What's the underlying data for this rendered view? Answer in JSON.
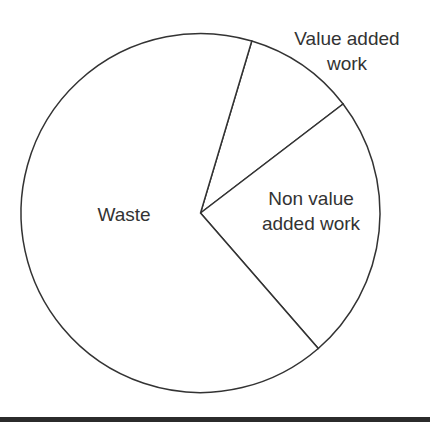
{
  "chart_data": {
    "type": "pie",
    "title": "",
    "start_angle_deg": 16.6,
    "direction": "clockwise",
    "slices": [
      {
        "label": "Value added work",
        "value": 10,
        "label_lines": [
          "Value added",
          "work"
        ]
      },
      {
        "label": "Non value added work",
        "value": 24,
        "label_lines": [
          "Non value",
          "added work"
        ]
      },
      {
        "label": "Waste",
        "value": 66,
        "label_lines": [
          "Waste"
        ]
      }
    ],
    "categories": [
      "Value added work",
      "Non value added work",
      "Waste"
    ],
    "values": [
      10,
      24,
      66
    ],
    "legend": "none (labels placed directly on/near slices)",
    "fill_color": "#ffffff",
    "stroke_color": "#333333"
  },
  "labels": {
    "value_added_line1": "Value added",
    "value_added_line2": "work",
    "non_value_line1": "Non value",
    "non_value_line2": "added work",
    "waste": "Waste"
  }
}
